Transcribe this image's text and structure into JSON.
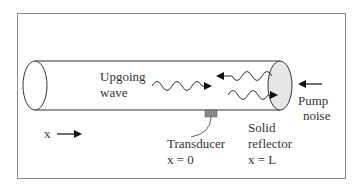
{
  "diagram": {
    "labels": {
      "upgoing_line1": "Upgoing",
      "upgoing_line2": "wave",
      "pump_line1": "Pump",
      "pump_line2": "noise",
      "reflector_line1": "Solid",
      "reflector_line2": "reflector",
      "reflector_line3": "x = L",
      "transducer_line1": "Transducer",
      "transducer_line2": "x = 0",
      "x_axis": "x"
    },
    "colors": {
      "frame": "#8a8a8a",
      "stroke": "#333333",
      "reflector_fill": "#e6e6e6",
      "transducer_fill": "#888888",
      "arrow": "#111111"
    },
    "icons": {
      "upgoing_wave": "wavy-arrow-right",
      "reflected_wave": "wavy-arrow-left",
      "second_wave": "wavy-arrow-right",
      "pump_noise_arrow": "arrow-left",
      "x_direction_arrow": "arrow-right"
    }
  }
}
